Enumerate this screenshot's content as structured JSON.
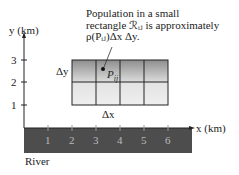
{
  "diagram": {
    "caption": {
      "line1": "Population in a small",
      "line2": "rectangle ℛᵢⱼ is approximately",
      "line3": "ρ(Pᵢⱼ)Δx Δy."
    },
    "axes": {
      "y_label": "y (km)",
      "x_label": "x (km)",
      "y_ticks": [
        "1",
        "2",
        "3"
      ],
      "x_ticks": [
        "1",
        "2",
        "3",
        "4",
        "5",
        "6"
      ]
    },
    "grid": {
      "x_range": [
        2,
        6
      ],
      "y_range": [
        1,
        3
      ],
      "columns": 4,
      "rows": 2,
      "point_label": "P",
      "point_subscript": "ij",
      "dx_label": "Δx",
      "dy_label": "Δy"
    },
    "river": {
      "label": "River",
      "color": "#4a4a4a"
    }
  }
}
